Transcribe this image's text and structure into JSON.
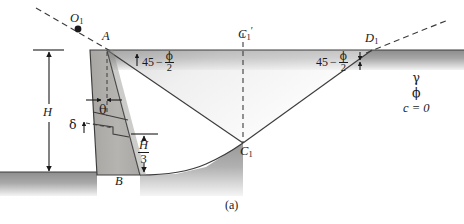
{
  "figure": {
    "caption": "(a)",
    "background_color": "#ffffff",
    "line_color": "#3c3c3c",
    "ground_fill_color": "#9a9a9a",
    "wall_fill_color": "#b0aeaa"
  },
  "points": {
    "O1": {
      "label": "O",
      "subscript": "1",
      "prime": ""
    },
    "A": {
      "label": "A",
      "subscript": "",
      "prime": ""
    },
    "B": {
      "label": "B",
      "subscript": "",
      "prime": ""
    },
    "C1": {
      "label": "C",
      "subscript": "1",
      "prime": ""
    },
    "C1prime": {
      "label": "C",
      "subscript": "1",
      "prime": "′"
    },
    "D1": {
      "label": "D",
      "subscript": "1",
      "prime": ""
    }
  },
  "angles": {
    "left_wedge": {
      "constant": "45",
      "operator": "−",
      "numerator": "ϕ",
      "denominator": "2"
    },
    "right_wedge": {
      "constant": "45",
      "operator": "−",
      "numerator": "ϕ",
      "denominator": "2"
    },
    "wall_batter": "θ",
    "wall_friction": "δ"
  },
  "dimensions": {
    "height": "H",
    "third_height_numerator": "H",
    "third_height_denominator": "3"
  },
  "soil_properties": {
    "unit_weight": "γ",
    "friction_angle": "ϕ",
    "cohesion": "c = 0"
  }
}
